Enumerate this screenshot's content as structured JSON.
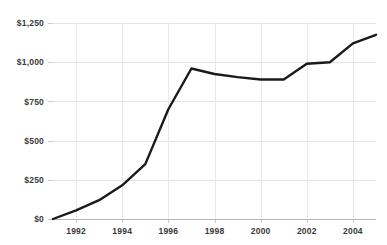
{
  "chart_data": {
    "type": "line",
    "title": "",
    "subtitle": "",
    "xlabel": "",
    "ylabel": "",
    "x": [
      1991,
      1992,
      1993,
      1994,
      1995,
      1996,
      1997,
      1998,
      1999,
      2000,
      2001,
      2002,
      2003,
      2004,
      2005
    ],
    "series": [
      {
        "name": "value",
        "values": [
          0,
          55,
          120,
          215,
          350,
          700,
          960,
          925,
          905,
          890,
          890,
          990,
          1000,
          1120,
          1175
        ]
      }
    ],
    "xlim": [
      1991,
      1005.5
    ],
    "ylim": [
      0,
      1250
    ],
    "y_ticks": [
      0,
      250,
      500,
      750,
      1000,
      1250
    ],
    "y_tick_labels": [
      "$0",
      "$250",
      "$500",
      "$750",
      "$1,000",
      "$1,250"
    ],
    "x_ticks": [
      1992,
      1994,
      1996,
      1998,
      2000,
      2002,
      2004
    ],
    "x_tick_labels": [
      "1992",
      "1994",
      "1996",
      "1998",
      "2000",
      "2002",
      "2004"
    ],
    "grid": true,
    "grid_axes": "both",
    "legend": false,
    "legend_position": "none",
    "annotations": [],
    "colors": {
      "line": "#1a1a1a",
      "grid": "#e4e4e4",
      "axis": "#b8b8b8",
      "tick_text": "#3a3a3a",
      "background": "#ffffff"
    }
  }
}
